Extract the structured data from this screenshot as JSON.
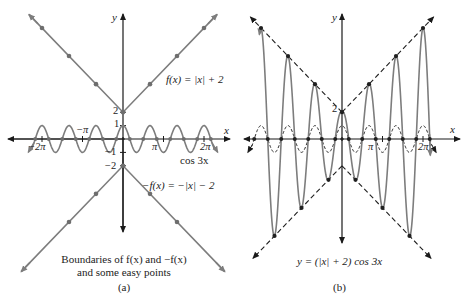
{
  "colors": {
    "curve": "#7d7d7d",
    "axis": "#1a1a1a",
    "point": "#6e6e6e",
    "dashed": "#1f1f1f",
    "text": "#222222",
    "background": "#ffffff"
  },
  "panel_a": {
    "axis_x_label": "x",
    "axis_y_label": "y",
    "tick_labels": {
      "y_pos2": "2",
      "y_pos1": "1",
      "y_neg1": "−1",
      "y_neg2": "−2",
      "x_neg2pi": "−2π",
      "x_negpi": "−π",
      "x_pi": "π",
      "x_2pi": "2π"
    },
    "label_f": "f(x) = |x| + 2",
    "label_neg_f": "−f(x) = −|x| − 2",
    "label_cos": "cos 3x",
    "caption_line1": "Boundaries of f(x) and −f(x)",
    "caption_line2": "and some easy points",
    "panel_tag": "(a)"
  },
  "panel_b": {
    "axis_x_label": "x",
    "axis_y_label": "y",
    "tick_labels": {
      "y_pos2": "2",
      "x_pi": "π",
      "x_2pi": "2π"
    },
    "equation": "y = (|x| + 2) cos 3x",
    "panel_tag": "(b)"
  },
  "chart_data": [
    {
      "type": "line",
      "title": "Boundaries of f(x) and −f(x) and some easy points",
      "panel": "(a)",
      "xlabel": "x",
      "ylabel": "y",
      "xlim": [
        -7.3,
        7.3
      ],
      "ylim": [
        -7.2,
        9.2
      ],
      "x_ticks": [
        "−2π",
        "−π",
        "π",
        "2π"
      ],
      "y_ticks": [
        "−2",
        "−1",
        "1",
        "2"
      ],
      "grid": false,
      "series": [
        {
          "name": "f(x) = |x| + 2",
          "expr": "|x|+2",
          "style": "solid",
          "markers_at_x": [
            -6.283,
            -4.189,
            -2.094,
            2.094,
            4.189,
            6.283
          ]
        },
        {
          "name": "−f(x) = −|x| − 2",
          "expr": "-|x|-2",
          "style": "solid",
          "markers_at_x": [
            -4.189,
            -2.094,
            2.094,
            4.189
          ]
        },
        {
          "name": "cos 3x",
          "expr": "cos(3x)",
          "style": "solid",
          "markers": "zeros at x = π/6 + kπ/3"
        }
      ]
    },
    {
      "type": "line",
      "title": "y = (|x| + 2) cos 3x",
      "panel": "(b)",
      "xlabel": "x",
      "ylabel": "y",
      "xlim": [
        -7.3,
        7.3
      ],
      "ylim": [
        -8.3,
        9.2
      ],
      "x_ticks": [
        "π",
        "2π"
      ],
      "y_ticks": [
        "2"
      ],
      "grid": false,
      "series": [
        {
          "name": "y = (|x| + 2) cos 3x",
          "expr": "(|x|+2)cos(3x)",
          "style": "solid"
        },
        {
          "name": "|x| + 2",
          "expr": "|x|+2",
          "style": "dashed"
        },
        {
          "name": "−|x| − 2",
          "expr": "-|x|-2",
          "style": "dashed"
        },
        {
          "name": "cos 3x",
          "expr": "cos(3x)",
          "style": "dashed"
        }
      ],
      "peaks": [
        {
          "x": "−2π",
          "y": 8.28
        },
        {
          "x": "−4π/3",
          "y": 6.19
        },
        {
          "x": "−2π/3",
          "y": 4.09
        },
        {
          "x": "0",
          "y": 2
        },
        {
          "x": "2π/3",
          "y": 4.09
        },
        {
          "x": "4π/3",
          "y": 6.19
        },
        {
          "x": "2π",
          "y": 8.28
        }
      ],
      "troughs": [
        {
          "x": "−5π/3",
          "y": -7.24
        },
        {
          "x": "−π",
          "y": -5.14
        },
        {
          "x": "−π/3",
          "y": -3.05
        },
        {
          "x": "π/3",
          "y": -3.05
        },
        {
          "x": "π",
          "y": -5.14
        },
        {
          "x": "5π/3",
          "y": -7.24
        }
      ]
    }
  ]
}
